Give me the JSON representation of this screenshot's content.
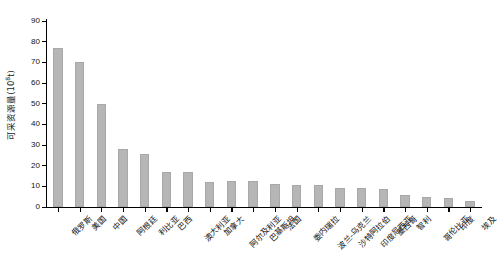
{
  "chart_data": {
    "type": "bar",
    "title": "",
    "xlabel": "",
    "ylabel": "可采资源量(10⁸t)",
    "ylabel_main": "可采资源量(10",
    "ylabel_sup": "8",
    "ylabel_tail": "t)",
    "ylim": [
      0,
      90
    ],
    "ytick_labels": [
      "90",
      "80",
      "70",
      "60",
      "50",
      "40",
      "30",
      "20",
      "10",
      "0"
    ],
    "ytick_values": [
      90,
      80,
      70,
      60,
      50,
      40,
      30,
      20,
      10,
      0
    ],
    "grid": false,
    "legend": false,
    "bar_color": "#b6b6b6",
    "axis_color": "#000000",
    "categories": [
      "俄罗斯",
      "美国",
      "中国",
      "阿根廷",
      "利比亚",
      "巴西",
      "澳大利亚",
      "加拿大",
      "阿尔及利亚",
      "巴基斯坦",
      "法国",
      "委内瑞拉",
      "波兰-乌克兰",
      "沙特阿拉伯",
      "印度尼西亚",
      "墨西哥",
      "智利",
      "哥伦比亚",
      "印度",
      "埃及"
    ],
    "values": [
      77,
      70,
      50,
      28,
      25.5,
      17,
      17,
      12,
      12.5,
      12.5,
      11,
      10.5,
      10.5,
      9,
      9,
      8.5,
      6,
      5,
      4.5,
      3
    ]
  }
}
